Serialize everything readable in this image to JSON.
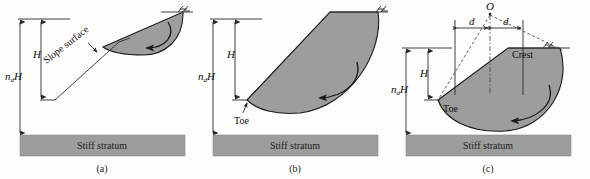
{
  "figure": {
    "background_color": "#fdfdfb",
    "soil_fill_color": "#9d9d9d",
    "stratum_fill_color": "#9d9d9d",
    "line_color": "#1b1b1b"
  },
  "panels": [
    {
      "id": "a",
      "caption": "(a)",
      "failure_type": "slope-failure",
      "labels": {
        "slope_surface": "Slope surface",
        "height": "H",
        "depth": "n",
        "depth_sub": "d",
        "depth_tail": "H",
        "stratum": "Stiff stratum"
      }
    },
    {
      "id": "b",
      "caption": "(b)",
      "failure_type": "toe-failure",
      "labels": {
        "toe": "Toe",
        "height": "H",
        "depth": "n",
        "depth_sub": "d",
        "depth_tail": "H",
        "stratum": "Stiff stratum"
      }
    },
    {
      "id": "c",
      "caption": "(c)",
      "failure_type": "base-failure",
      "labels": {
        "center": "O",
        "distance_left": "d",
        "distance_right": "d",
        "crest": "Crest",
        "toe": "Toe",
        "height": "H",
        "depth": "n",
        "depth_sub": "d",
        "depth_tail": "H",
        "stratum": "Stiff stratum"
      }
    }
  ],
  "icons": {
    "ground_surface_hatch": "ground-surface-hatch-icon",
    "rotation_arrow": "rotation-arrow-icon"
  }
}
